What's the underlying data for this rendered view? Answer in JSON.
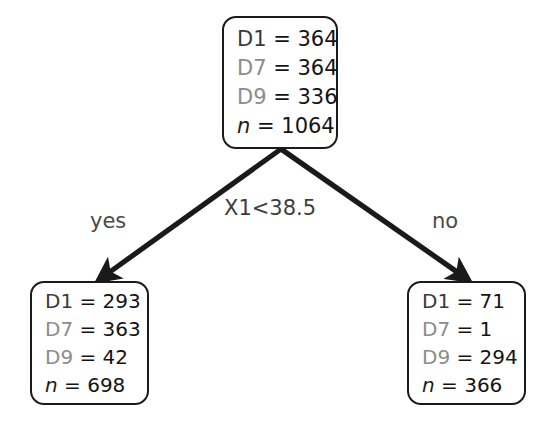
{
  "diagram": {
    "type": "decision-tree",
    "title": "",
    "split": {
      "condition": "X1<38.5",
      "yes_label": "yes",
      "no_label": "no"
    },
    "nodes": {
      "root": {
        "id": "root",
        "rows": [
          {
            "label": "D1",
            "sep": " = ",
            "value": "364"
          },
          {
            "label": "D7",
            "sep": " = ",
            "value": "364"
          },
          {
            "label": "D9",
            "sep": " = ",
            "value": "336"
          },
          {
            "label": "n",
            "sep": " = ",
            "value": "1064"
          }
        ]
      },
      "left": {
        "id": "left-child",
        "rows": [
          {
            "label": "D1",
            "sep": " = ",
            "value": "293"
          },
          {
            "label": "D7",
            "sep": " = ",
            "value": "363"
          },
          {
            "label": "D9",
            "sep": " = ",
            "value": "42"
          },
          {
            "label": "n",
            "sep": " = ",
            "value": "698"
          }
        ]
      },
      "right": {
        "id": "right-child",
        "rows": [
          {
            "label": "D1",
            "sep": " = ",
            "value": "71"
          },
          {
            "label": "D7",
            "sep": " = ",
            "value": "1"
          },
          {
            "label": "D9",
            "sep": " = ",
            "value": "294"
          },
          {
            "label": "n",
            "sep": " = ",
            "value": "366"
          }
        ]
      }
    },
    "colors": {
      "border": "#1a1a1a",
      "edge": "#1a1a1a",
      "label_gray": "#8c8c8c",
      "value_black": "#141414",
      "background": "#ffffff"
    }
  }
}
